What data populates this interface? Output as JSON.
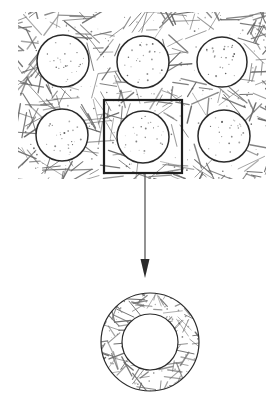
{
  "figure": {
    "background_color": "#ffffff",
    "width": 275,
    "height": 403,
    "line_color": "#2b2b2b",
    "hatch_color": "#6b6b6b",
    "stipple_color": "#555555",
    "leader_color": "#4a4a4a"
  },
  "matrix_block": {
    "name": "hatched-matrix-region",
    "x": 18,
    "y": 12,
    "width": 248,
    "height": 167,
    "fill_pattern": "random-cross-hatch",
    "hatch_stroke_width": 1.1
  },
  "inclusions": [
    {
      "id": "circle-top-left",
      "cx": 63,
      "cy": 61,
      "r": 26
    },
    {
      "id": "circle-top-center",
      "cx": 143,
      "cy": 62,
      "r": 26
    },
    {
      "id": "circle-top-right",
      "cx": 222,
      "cy": 62,
      "r": 25
    },
    {
      "id": "circle-bottom-left",
      "cx": 62,
      "cy": 135,
      "r": 26
    },
    {
      "id": "circle-bottom-center",
      "cx": 143,
      "cy": 137,
      "r": 26
    },
    {
      "id": "circle-bottom-right",
      "cx": 224,
      "cy": 136,
      "r": 26
    }
  ],
  "selection_box": {
    "name": "unit-cell-selection",
    "x": 104,
    "y": 100,
    "width": 78,
    "height": 73,
    "stroke_width": 2.2,
    "stroke_color": "#1f1f1f",
    "fill": "none"
  },
  "leader": {
    "name": "magnification-leader",
    "x": 145,
    "y_start": 174,
    "y_end": 262,
    "stroke_width": 1.2,
    "arrow_tip_y": 278,
    "arrow_half_width": 4.5
  },
  "annulus": {
    "name": "magnified-unit-cell",
    "cx": 150,
    "cy": 342,
    "outer_r": 49,
    "inner_r": 28,
    "stroke_width": 1.2,
    "fill_pattern": "random-cross-hatch"
  },
  "labels": {
    "matrix": "",
    "inclusion": "",
    "unit_cell": ""
  }
}
